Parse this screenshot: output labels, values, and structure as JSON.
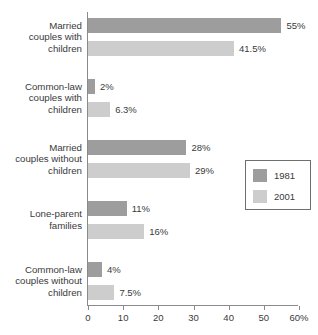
{
  "chart_data": {
    "type": "bar",
    "orientation": "horizontal",
    "title": "",
    "subtitle": "",
    "xlabel": "",
    "ylabel": "",
    "xlim": [
      0,
      60
    ],
    "xticks": [
      0,
      10,
      20,
      30,
      40,
      50,
      60
    ],
    "xtick_labels": [
      "0",
      "10",
      "20",
      "30",
      "40",
      "50",
      "60%"
    ],
    "grid": false,
    "legend_position": "center-right",
    "categories": [
      "Married couples with children",
      "Common-law couples with children",
      "Married couples without children",
      "Lone-parent families",
      "Common-law couples without children"
    ],
    "series": [
      {
        "name": "1981",
        "color": "#9d9d9d",
        "values": [
          55,
          2,
          28,
          11,
          4
        ],
        "value_labels": [
          "55%",
          "2%",
          "28%",
          "11%",
          "4%"
        ]
      },
      {
        "name": "2001",
        "color": "#cdcdcd",
        "values": [
          41.5,
          6.3,
          29,
          16,
          7.5
        ],
        "value_labels": [
          "41.5%",
          "6.3%",
          "29%",
          "16%",
          "7.5%"
        ]
      }
    ]
  },
  "category_lines": [
    [
      "Married",
      "couples with",
      "children"
    ],
    [
      "Common-law",
      "couples with",
      "children"
    ],
    [
      "Married",
      "couples without",
      "children"
    ],
    [
      "Lone-parent",
      "families"
    ],
    [
      "Common-law",
      "couples without",
      "children"
    ]
  ],
  "legend": {
    "items": [
      {
        "label": "1981",
        "color": "#9d9d9d"
      },
      {
        "label": "2001",
        "color": "#cdcdcd"
      }
    ]
  },
  "colors": {
    "background": "#ffffff",
    "axis": "#8a8a8a",
    "text": "#3a3a3a",
    "legend_border": "#6f6f6f",
    "series_1981": "#9d9d9d",
    "series_2001": "#cdcdcd"
  }
}
